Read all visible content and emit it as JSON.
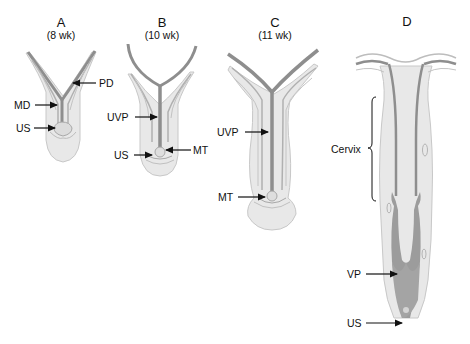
{
  "panels": [
    {
      "id": "A",
      "title": "A",
      "subtitle": "(8 wk)"
    },
    {
      "id": "B",
      "title": "B",
      "subtitle": "(10 wk)"
    },
    {
      "id": "C",
      "title": "C",
      "subtitle": "(11 wk)"
    },
    {
      "id": "D",
      "title": "D",
      "subtitle": ""
    }
  ],
  "labels": {
    "A": {
      "pd": "PD",
      "md": "MD",
      "us": "US"
    },
    "B": {
      "uvp": "UVP",
      "us": "US",
      "mt": "MT"
    },
    "C": {
      "uvp": "UVP",
      "mt": "MT"
    },
    "D": {
      "cervix": "Cervix",
      "vp": "VP",
      "us": "US"
    }
  },
  "colors": {
    "tissue_fill": "#e6e6e6",
    "tissue_light": "#efefef",
    "outline": "#c4c4c4",
    "duct": "#8e8e8e",
    "duct_mid": "#a8a8a8",
    "vaginal_plate": "#9a9a9a",
    "arrow": "#111111"
  }
}
